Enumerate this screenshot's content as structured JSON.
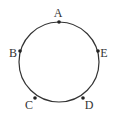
{
  "diagram": {
    "type": "circle-with-points",
    "circle": {
      "cx": 59,
      "cy": 62,
      "r": 40,
      "stroke": "#333333"
    },
    "points": [
      {
        "id": "A",
        "label": "A",
        "x": 59,
        "y": 22,
        "lx": 58,
        "ly": 17
      },
      {
        "id": "B",
        "label": "B",
        "x": 20,
        "y": 51,
        "lx": 13,
        "ly": 57
      },
      {
        "id": "C",
        "label": "C",
        "x": 35,
        "y": 98,
        "lx": 29,
        "ly": 109
      },
      {
        "id": "D",
        "label": "D",
        "x": 83,
        "y": 98,
        "lx": 89,
        "ly": 109
      },
      {
        "id": "E",
        "label": "E",
        "x": 98,
        "y": 51,
        "lx": 104,
        "ly": 57
      }
    ]
  }
}
